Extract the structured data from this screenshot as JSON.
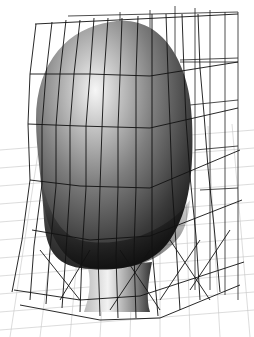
{
  "figure": {
    "background_color": "#ffffff",
    "colors": {
      "head_highlight": "#f4f4f4",
      "head_mid": "#8c8c8c",
      "head_dark": "#2a2a2a",
      "lattice_line": "#1a1a1a",
      "floor_grid": "#bdbdbd",
      "neck_light": "#e8e8e8"
    },
    "lattice": {
      "columns": 9,
      "rows": 4,
      "top_y": 22,
      "bottom_y": 300
    },
    "floor_grid": {
      "spacing": 18
    }
  }
}
